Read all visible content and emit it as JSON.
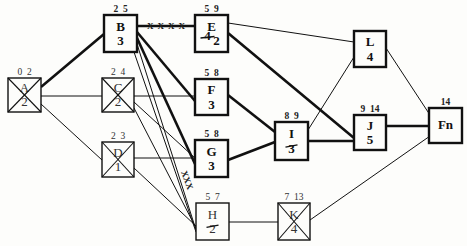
{
  "diagram": {
    "type": "activity-on-node network",
    "nodes": [
      {
        "id": "A",
        "name": "A",
        "duration": "2",
        "times": "0 2",
        "crossed": true,
        "critical": false
      },
      {
        "id": "B",
        "name": "B",
        "duration": "3",
        "times": "2 5",
        "crossed": false,
        "critical": true
      },
      {
        "id": "C",
        "name": "C",
        "duration": "2",
        "times": "2 4",
        "crossed": true,
        "critical": false
      },
      {
        "id": "D",
        "name": "D",
        "duration": "1",
        "times": "2 3",
        "crossed": true,
        "critical": false
      },
      {
        "id": "E",
        "name": "E",
        "duration": "2",
        "times": "5 9",
        "crossed": false,
        "critical": true,
        "struck_duration": "4"
      },
      {
        "id": "F",
        "name": "F",
        "duration": "3",
        "times": "5 8",
        "crossed": false,
        "critical": true
      },
      {
        "id": "G",
        "name": "G",
        "duration": "3",
        "times": "5 8",
        "crossed": false,
        "critical": true
      },
      {
        "id": "H",
        "name": "H",
        "duration": "2",
        "times": "5 7",
        "crossed": false,
        "critical": false,
        "struck_duration": "2"
      },
      {
        "id": "I",
        "name": "I",
        "duration": "3",
        "times": "8 9",
        "crossed": false,
        "critical": true,
        "struck_duration": "1"
      },
      {
        "id": "J",
        "name": "J",
        "duration": "5",
        "times": "9 14",
        "crossed": false,
        "critical": true
      },
      {
        "id": "K",
        "name": "K",
        "duration": "4",
        "times": "7 13",
        "crossed": true,
        "critical": false
      },
      {
        "id": "L",
        "name": "L",
        "duration": "4",
        "times": "",
        "crossed": false,
        "critical": true
      },
      {
        "id": "Fn",
        "name": "Fn",
        "duration": "",
        "times": "14",
        "crossed": false,
        "critical": true
      }
    ],
    "edges": [
      {
        "from": "A",
        "to": "B",
        "weight": "thick"
      },
      {
        "from": "A",
        "to": "C",
        "weight": "thin"
      },
      {
        "from": "A",
        "to": "D",
        "weight": "thin"
      },
      {
        "from": "B",
        "to": "E",
        "weight": "thick",
        "marked": "XXXX"
      },
      {
        "from": "B",
        "to": "F",
        "weight": "thick"
      },
      {
        "from": "B",
        "to": "G",
        "weight": "thick"
      },
      {
        "from": "B",
        "to": "H",
        "weight": "thin"
      },
      {
        "from": "B",
        "to": "H",
        "weight": "thin",
        "marked": "XXX"
      },
      {
        "from": "C",
        "to": "F",
        "weight": "thin"
      },
      {
        "from": "C",
        "to": "G",
        "weight": "thin"
      },
      {
        "from": "C",
        "to": "H",
        "weight": "thin"
      },
      {
        "from": "D",
        "to": "G",
        "weight": "thin"
      },
      {
        "from": "D",
        "to": "H",
        "weight": "thin"
      },
      {
        "from": "E",
        "to": "L",
        "weight": "thin"
      },
      {
        "from": "E",
        "to": "J",
        "weight": "thick"
      },
      {
        "from": "F",
        "to": "I",
        "weight": "thick"
      },
      {
        "from": "G",
        "to": "I",
        "weight": "thick"
      },
      {
        "from": "I",
        "to": "L",
        "weight": "thin"
      },
      {
        "from": "I",
        "to": "J",
        "weight": "thick"
      },
      {
        "from": "H",
        "to": "K",
        "weight": "thin"
      },
      {
        "from": "L",
        "to": "Fn",
        "weight": "thin"
      },
      {
        "from": "J",
        "to": "Fn",
        "weight": "thick"
      },
      {
        "from": "K",
        "to": "Fn",
        "weight": "thin"
      }
    ],
    "marks": {
      "be_edge": "XXXX",
      "bh_edge": "XXX"
    }
  }
}
